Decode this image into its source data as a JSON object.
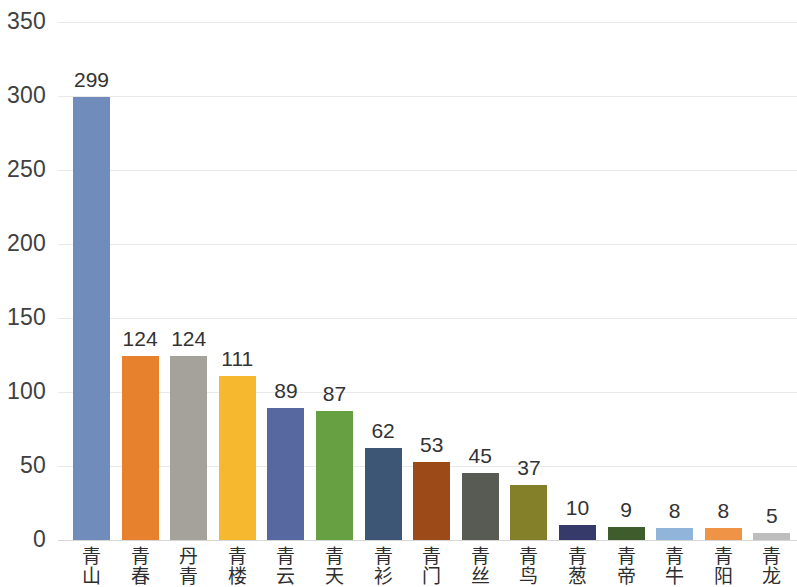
{
  "chart_data": {
    "type": "bar",
    "title": "",
    "subtitle": "",
    "xlabel": "",
    "ylabel": "",
    "ylim": [
      0,
      350
    ],
    "ytick_labels": [
      "350",
      "300",
      "250",
      "200",
      "150",
      "100",
      "50",
      "0"
    ],
    "ytick_values": [
      350,
      300,
      250,
      200,
      150,
      100,
      50,
      0
    ],
    "grid": true,
    "legend": "none",
    "categories": [
      "青山",
      "青春",
      "丹青",
      "青楼",
      "青云",
      "青天",
      "青衫",
      "青门",
      "青丝",
      "青鸟",
      "青葱",
      "青帝",
      "青牛",
      "青阳",
      "青龙"
    ],
    "values": [
      299,
      124,
      124,
      111,
      89,
      87,
      62,
      53,
      45,
      37,
      10,
      9,
      8,
      8,
      5
    ],
    "value_labels": [
      "299",
      "124",
      "124",
      "111",
      "89",
      "87",
      "62",
      "53",
      "45",
      "37",
      "10",
      "9",
      "8",
      "8",
      "5"
    ],
    "bar_colors": [
      "#6f8cba",
      "#e8812d",
      "#a5a29b",
      "#f6b82e",
      "#56689f",
      "#66a042",
      "#3d5676",
      "#9c4a17",
      "#585a54",
      "#84802a",
      "#363a6b",
      "#3f5c2c",
      "#90b4da",
      "#ef9447",
      "#bdbdbd"
    ]
  },
  "colors": {
    "background": "#ffffff",
    "gridline": "#e9e9e9",
    "axis": "#d6d6d6",
    "tick_text": "#404040",
    "value_text": "#333333",
    "category_text": "#2e2e2e"
  }
}
